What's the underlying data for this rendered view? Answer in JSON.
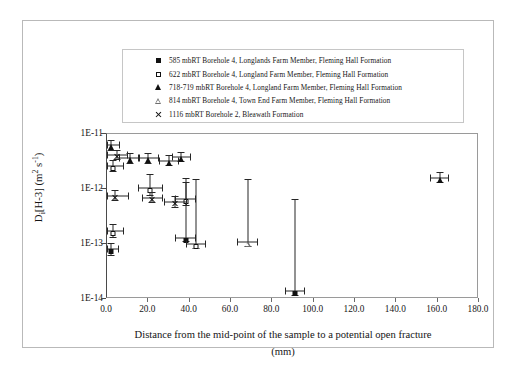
{
  "figure": {
    "yaxis_title_parts": {
      "main": "D",
      "sub": "i",
      "species": "[H-3] (m",
      "sup2": "2",
      "unit": " s",
      "sup1": "-1",
      "close": ")"
    },
    "yaxis_title_plain": "Di[H-3] (m2 s-1)",
    "xaxis_title_line1": "Distance from the mid-point of the sample to a potential open fracture",
    "xaxis_title_line2": "(mm)"
  },
  "legend": {
    "items": [
      {
        "marker": "filled-square",
        "label": "585 mbRT Borehole 4, Longlands Farm Member, Fleming Hall Formation"
      },
      {
        "marker": "open-square",
        "label": "622 mbRT Borehole 4, Longland Farm Member, Fleming Hall Formation"
      },
      {
        "marker": "filled-triangle",
        "label": "718-719 mbRT Borehole 4, Longland Farm Member, Fleming Hall Formation"
      },
      {
        "marker": "open-triangle",
        "label": "814 mbRT Borehole 4, Town End Farm Member, Fleming Hall Formation"
      },
      {
        "marker": "cross",
        "label": "1116 mbRT Borehole 2, Bleawath Formation"
      }
    ]
  },
  "chart_data": {
    "type": "scatter",
    "title": "",
    "xlabel": "Distance from the mid-point of the sample to a potential open fracture (mm)",
    "ylabel": "Di[H-3] (m2 s-1)",
    "xlim": [
      0.0,
      180.0
    ],
    "ylim": [
      1e-14,
      1e-11
    ],
    "yscale": "log",
    "xticks": [
      "0.0",
      "20.0",
      "40.0",
      "60.0",
      "80.0",
      "100.0",
      "120.0",
      "140.0",
      "160.0",
      "180.0"
    ],
    "xtick_values": [
      0,
      20,
      40,
      60,
      80,
      100,
      120,
      140,
      160,
      180
    ],
    "yticks": [
      "1E-11",
      "1E-12",
      "1E-13",
      "1E-14"
    ],
    "ytick_values": [
      1e-11,
      1e-12,
      1e-13,
      1e-14
    ],
    "grid": false,
    "legend_position": "above-plot",
    "series": [
      {
        "name": "585 mbRT Borehole 4, Longlands Farm Member, Fleming Hall Formation",
        "marker": "filled-square",
        "points": [
          {
            "x": 2.0,
            "y": 8e-14,
            "xerr": 4.0,
            "ylo": 6e-14,
            "yhi": 1.05e-13
          },
          {
            "x": 38.0,
            "y": 1.3e-13,
            "xerr": 5.0,
            "ylo": 1.1e-13,
            "yhi": 1.6e-12
          },
          {
            "x": 91.0,
            "y": 1.4e-14,
            "xerr": 5.0,
            "ylo": 1.15e-14,
            "yhi": 6.5e-13
          }
        ]
      },
      {
        "name": "622 mbRT Borehole 4, Longland Farm Member, Fleming Hall Formation",
        "marker": "open-square",
        "points": [
          {
            "x": 3.0,
            "y": 2.6e-12,
            "xerr": 5.0,
            "ylo": 2e-12,
            "yhi": 3.4e-12
          },
          {
            "x": 3.0,
            "y": 1.7e-13,
            "xerr": 5.0,
            "ylo": 1.3e-13,
            "yhi": 2.3e-13
          },
          {
            "x": 21.0,
            "y": 1.05e-12,
            "xerr": 6.0,
            "ylo": 7.5e-13,
            "yhi": 1.9e-12
          },
          {
            "x": 38.0,
            "y": 6.5e-13,
            "xerr": 5.0,
            "ylo": 5e-13,
            "yhi": 1.35e-12
          },
          {
            "x": 43.0,
            "y": 1e-13,
            "xerr": 5.0,
            "ylo": 8e-14,
            "yhi": 1.5e-12
          }
        ]
      },
      {
        "name": "718-719 mbRT Borehole 4, Longland Farm Member, Fleming Hall Formation",
        "marker": "filled-triangle",
        "points": [
          {
            "x": 2.0,
            "y": 6.2e-12,
            "xerr": 4.5,
            "ylo": 5e-12,
            "yhi": 7.8e-12
          },
          {
            "x": 11.0,
            "y": 3.6e-12,
            "xerr": 5.0,
            "ylo": 2.9e-12,
            "yhi": 4.6e-12
          },
          {
            "x": 20.0,
            "y": 3.6e-12,
            "xerr": 5.0,
            "ylo": 2.9e-12,
            "yhi": 4.6e-12
          },
          {
            "x": 30.0,
            "y": 3.2e-12,
            "xerr": 5.0,
            "ylo": 2.6e-12,
            "yhi": 4.2e-12
          },
          {
            "x": 36.0,
            "y": 3.8e-12,
            "xerr": 4.5,
            "ylo": 3.1e-12,
            "yhi": 4.8e-12
          },
          {
            "x": 161.0,
            "y": 1.6e-12,
            "xerr": 4.5,
            "ylo": 1.3e-12,
            "yhi": 2e-12
          }
        ]
      },
      {
        "name": "814 mbRT Borehole 4, Town End Farm Member, Fleming Hall Formation",
        "marker": "open-triangle",
        "points": [
          {
            "x": 68.0,
            "y": 1.1e-13,
            "xerr": 5.0,
            "ylo": 9e-14,
            "yhi": 1.5e-12
          }
        ]
      },
      {
        "name": "1116 mbRT Borehole 2, Bleawath Formation",
        "marker": "cross",
        "points": [
          {
            "x": 5.0,
            "y": 4.1e-12,
            "xerr": 5.0,
            "ylo": 3.3e-12,
            "yhi": 5.2e-12
          },
          {
            "x": 4.0,
            "y": 7.5e-13,
            "xerr": 6.5,
            "ylo": 6e-13,
            "yhi": 9.5e-13
          },
          {
            "x": 22.0,
            "y": 7e-13,
            "xerr": 5.0,
            "ylo": 5.5e-13,
            "yhi": 9e-13
          },
          {
            "x": 33.0,
            "y": 5.8e-13,
            "xerr": 5.5,
            "ylo": 4.6e-13,
            "yhi": 7.4e-13
          }
        ]
      }
    ]
  }
}
